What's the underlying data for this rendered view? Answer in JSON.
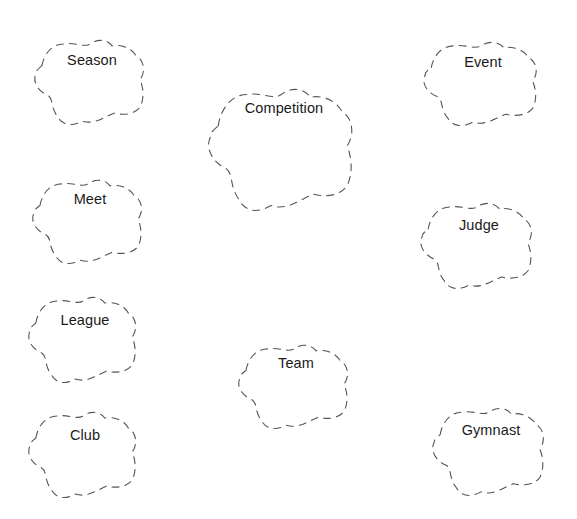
{
  "diagram": {
    "type": "class-cloud-diagram",
    "stroke_color": "#555555",
    "text_color": "#1a1a1a",
    "background": "#ffffff",
    "classes": [
      {
        "label": "Season",
        "x": 32,
        "y": 38,
        "w": 120,
        "h": 89,
        "label_top": 14
      },
      {
        "label": "Competition",
        "x": 205,
        "y": 86,
        "w": 158,
        "h": 128,
        "label_top": 14
      },
      {
        "label": "Event",
        "x": 421,
        "y": 40,
        "w": 124,
        "h": 88,
        "label_top": 14
      },
      {
        "label": "Meet",
        "x": 30,
        "y": 178,
        "w": 120,
        "h": 88,
        "label_top": 13
      },
      {
        "label": "Judge",
        "x": 418,
        "y": 201,
        "w": 122,
        "h": 90,
        "label_top": 16
      },
      {
        "label": "League",
        "x": 26,
        "y": 295,
        "w": 118,
        "h": 90,
        "label_top": 17
      },
      {
        "label": "Team",
        "x": 236,
        "y": 343,
        "w": 120,
        "h": 88,
        "label_top": 12
      },
      {
        "label": "Club",
        "x": 26,
        "y": 410,
        "w": 118,
        "h": 90,
        "label_top": 17
      },
      {
        "label": "Gymnast",
        "x": 430,
        "y": 406,
        "w": 122,
        "h": 92,
        "label_top": 16
      }
    ]
  }
}
